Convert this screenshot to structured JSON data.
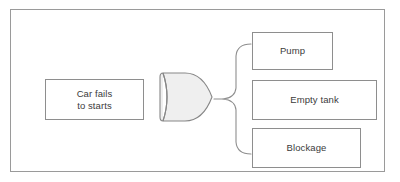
{
  "diagram": {
    "type": "fault-tree",
    "frame": {
      "border_color": "#9a9a9a",
      "background": "#ffffff"
    },
    "top_event": {
      "label": "Car fails\nto starts",
      "line_1": "Car fails",
      "line_2": "to starts"
    },
    "gate": {
      "kind": "or-gate",
      "label": "",
      "fill_color": "#efefef",
      "stroke_color": "#878787"
    },
    "connector": {
      "kind": "curly-brace",
      "stroke_color": "#8e8e8e"
    },
    "causes": [
      {
        "label": "Pump"
      },
      {
        "label": "Empty tank"
      },
      {
        "label": "Blockage"
      }
    ],
    "colors": {
      "box_border": "#8e8e8e",
      "text": "#3b3b3b",
      "box_fill": "#ffffff"
    }
  }
}
